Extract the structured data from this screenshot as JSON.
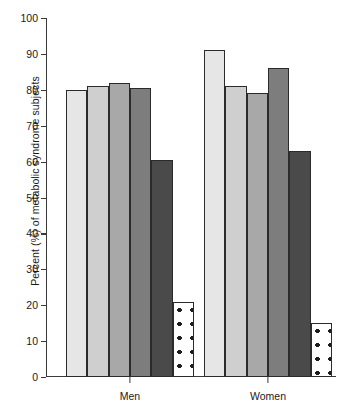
{
  "chart_data": {
    "type": "bar",
    "title": "",
    "xlabel": "",
    "ylabel": "Percent (%) of metabolic syndrome subjects",
    "ylim": [
      0,
      100
    ],
    "ytick_labels": [
      "100",
      "90",
      "80",
      "70",
      "60",
      "50",
      "40",
      "30",
      "20",
      "10",
      "0"
    ],
    "ytick_values": [
      100,
      90,
      80,
      70,
      60,
      50,
      40,
      30,
      20,
      10,
      0
    ],
    "categories": [
      "Men",
      "Women"
    ],
    "grid": false,
    "legend": "none",
    "series": [
      {
        "name": "bar-1",
        "fill": "light-gray",
        "color": "#e6e6e6",
        "values": [
          80,
          91
        ]
      },
      {
        "name": "bar-2",
        "fill": "gray-2",
        "color": "#cfcfcf",
        "values": [
          81,
          81
        ]
      },
      {
        "name": "bar-3",
        "fill": "gray-3",
        "color": "#a8a8a8",
        "values": [
          82,
          79
        ]
      },
      {
        "name": "bar-4",
        "fill": "gray-4",
        "color": "#7d7d7d",
        "values": [
          80.5,
          86
        ]
      },
      {
        "name": "bar-5",
        "fill": "dark-gray",
        "color": "#4a4a4a",
        "values": [
          60.5,
          63
        ]
      },
      {
        "name": "bar-6",
        "fill": "dotted",
        "color": "#ffffff",
        "values": [
          21,
          15
        ]
      }
    ]
  },
  "axis": {
    "baseline_color": "#3a3a3a",
    "bar_outline_color": "#2b2b2b"
  }
}
